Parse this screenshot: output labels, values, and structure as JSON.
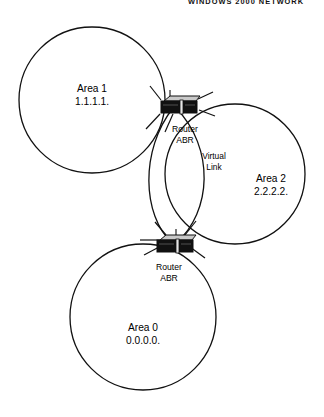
{
  "header": {
    "title": "WINDOWS 2000 NETWORK"
  },
  "diagram": {
    "type": "ospf-area-topology",
    "stroke_color": "#111111",
    "background_color": "#ffffff",
    "router_top_color": "#c9c9c9",
    "router_front_color": "#111111",
    "areas": [
      {
        "id": "area1",
        "name": "Area 1",
        "area_id": "1.1.1.1.",
        "label_line1": "Area 1",
        "label_line2": "1.1.1.1."
      },
      {
        "id": "area2",
        "name": "Area 2",
        "area_id": "2.2.2.2.",
        "label_line1": "Area 2",
        "label_line2": "2.2.2.2."
      },
      {
        "id": "area0",
        "name": "Area 0",
        "area_id": "0.0.0.0.",
        "label_line1": "Area 0",
        "label_line2": "0.0.0.0."
      }
    ],
    "routers": [
      {
        "id": "router-abr-top",
        "label_line1": "Router",
        "label_line2": "ABR"
      },
      {
        "id": "router-abr-bottom",
        "label_line1": "Router",
        "label_line2": "ABR"
      }
    ],
    "links": [
      {
        "id": "virtual-link",
        "label_line1": "Virtual",
        "label_line2": "Link"
      }
    ]
  }
}
